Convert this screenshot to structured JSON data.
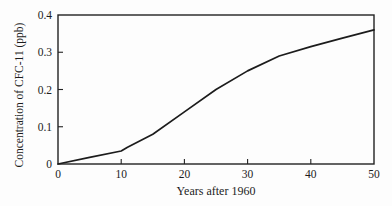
{
  "chart_data": {
    "type": "line",
    "title": "",
    "xlabel": "Years after 1960",
    "ylabel": "Concentration of CFC-11 (ppb)",
    "x": [
      0,
      5,
      10,
      11,
      15,
      20,
      25,
      30,
      35,
      40,
      45,
      50
    ],
    "y": [
      0,
      0.018,
      0.035,
      0.045,
      0.08,
      0.14,
      0.2,
      0.25,
      0.29,
      0.315,
      0.338,
      0.36
    ],
    "xlim": [
      0,
      50
    ],
    "ylim": [
      0,
      0.4
    ],
    "xticks": [
      0,
      10,
      20,
      30,
      40,
      50
    ],
    "yticks": [
      0,
      0.1,
      0.2,
      0.3,
      0.4
    ],
    "grid": "off",
    "legend": "none",
    "frame": "full-box",
    "line_color": "#1c1c1c",
    "axis_color": "#222222",
    "background_color": "#fdfdfd"
  }
}
